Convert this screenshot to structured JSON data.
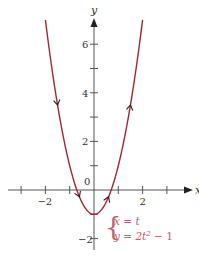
{
  "figure": {
    "type": "parametric-curve",
    "axes": {
      "x_label": "x",
      "y_label": "y",
      "x_ticks": [
        -3,
        -2,
        -1,
        1,
        2,
        3
      ],
      "x_tick_labels": [
        {
          "value": -2,
          "text": "−2"
        },
        {
          "value": 2,
          "text": "2"
        }
      ],
      "y_ticks": [
        -2,
        -1,
        1,
        2,
        3,
        4,
        5,
        6
      ],
      "y_tick_labels": [
        {
          "value": 6,
          "text": "6"
        },
        {
          "value": 4,
          "text": "4"
        },
        {
          "value": 2,
          "text": "2"
        },
        {
          "value": -2,
          "text": "−2"
        }
      ],
      "origin_label": "0",
      "x_range": [
        -3.5,
        4
      ],
      "y_range": [
        -2.6,
        7.2
      ]
    },
    "curve": {
      "x_equation": "x = t",
      "y_equation_prefix": "y = 2t",
      "y_equation_exp": "2",
      "y_equation_suffix": " − 1",
      "t_range": [
        -2,
        2
      ],
      "direction": "increasing t: down the left branch, up the right branch",
      "color": "#a8242e"
    },
    "colors": {
      "axis": "#555555",
      "curve": "#a8242e",
      "equation": "#c0606a",
      "label": "#333333"
    }
  }
}
